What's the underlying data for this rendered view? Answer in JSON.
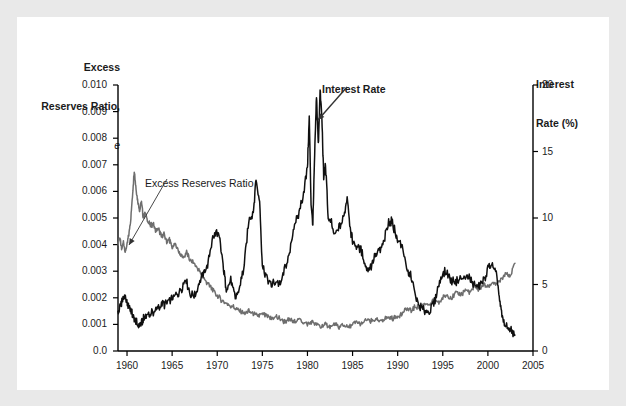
{
  "figure": {
    "background_color": "#e9e9e9",
    "panel_color": "#ffffff"
  },
  "chart_data": {
    "type": "line",
    "title": "",
    "xlabel": "",
    "ylabel": "Excess Reserves Ratio, e",
    "y2label": "Interest Rate (%)",
    "grid": false,
    "legend_position": "inline-annotations",
    "xlim": [
      1959.0,
      2005.0
    ],
    "ylim": [
      0.0,
      0.01
    ],
    "y2lim": [
      0,
      20
    ],
    "xticks": [
      1960,
      1965,
      1970,
      1975,
      1980,
      1985,
      1990,
      1995,
      2000,
      2005
    ],
    "xtick_labels": [
      "1960",
      "1965",
      "1970",
      "1975",
      "1980",
      "1985",
      "1990",
      "1995",
      "2000",
      "2005"
    ],
    "yticks": [
      0.0,
      0.001,
      0.002,
      0.003,
      0.004,
      0.005,
      0.006,
      0.007,
      0.008,
      0.009,
      0.01
    ],
    "ytick_labels": [
      "0.0",
      "0.001",
      "0.002",
      "0.003",
      "0.004",
      "0.005",
      "0.006",
      "0.007",
      "0.008",
      "0.009",
      "0.010"
    ],
    "y2ticks": [
      0,
      5,
      10,
      15,
      20
    ],
    "y2tick_labels": [
      "0",
      "5",
      "10",
      "15",
      "20"
    ],
    "series": [
      {
        "name": "Excess Reserves Ratio",
        "axis": "left",
        "color": "#6e6e6e",
        "annotation": "Excess Reserves Ratio",
        "x": [
          1959.0,
          1959.2,
          1959.4,
          1959.6,
          1959.8,
          1960.0,
          1960.2,
          1960.4,
          1960.6,
          1960.8,
          1961.0,
          1961.2,
          1961.4,
          1961.6,
          1961.8,
          1962.0,
          1962.3,
          1962.6,
          1962.9,
          1963.2,
          1963.5,
          1963.8,
          1964.1,
          1964.4,
          1964.7,
          1965.0,
          1965.4,
          1965.8,
          1966.2,
          1966.6,
          1967.0,
          1967.4,
          1967.8,
          1968.2,
          1968.6,
          1969.0,
          1969.5,
          1970.0,
          1970.5,
          1971.0,
          1971.5,
          1972.0,
          1972.5,
          1973.0,
          1973.5,
          1974.0,
          1974.5,
          1975.0,
          1975.5,
          1976.0,
          1976.5,
          1977.0,
          1977.5,
          1978.0,
          1978.5,
          1979.0,
          1979.5,
          1980.0,
          1980.5,
          1981.0,
          1981.5,
          1982.0,
          1982.5,
          1983.0,
          1983.5,
          1984.0,
          1984.5,
          1985.0,
          1985.5,
          1986.0,
          1986.5,
          1987.0,
          1987.5,
          1988.0,
          1988.5,
          1989.0,
          1989.5,
          1990.0,
          1990.5,
          1991.0,
          1991.5,
          1992.0,
          1992.5,
          1993.0,
          1993.5,
          1994.0,
          1994.5,
          1995.0,
          1995.5,
          1996.0,
          1996.5,
          1997.0,
          1997.5,
          1998.0,
          1998.5,
          1999.0,
          1999.5,
          2000.0,
          2000.5,
          2001.0,
          2001.5,
          2002.0,
          2002.5,
          2003.0
        ],
        "y": [
          0.004,
          0.0043,
          0.0038,
          0.0041,
          0.0037,
          0.004,
          0.0044,
          0.0049,
          0.0058,
          0.0068,
          0.0061,
          0.0056,
          0.0053,
          0.0056,
          0.005,
          0.0052,
          0.0049,
          0.0047,
          0.0048,
          0.0045,
          0.0046,
          0.0043,
          0.0044,
          0.0041,
          0.0042,
          0.0039,
          0.004,
          0.0037,
          0.0035,
          0.0037,
          0.0034,
          0.0033,
          0.0031,
          0.0029,
          0.0027,
          0.0025,
          0.0023,
          0.0021,
          0.0019,
          0.0018,
          0.0017,
          0.0016,
          0.0015,
          0.0014,
          0.0015,
          0.0014,
          0.0013,
          0.0014,
          0.0013,
          0.0012,
          0.0013,
          0.0012,
          0.0011,
          0.0012,
          0.0011,
          0.0012,
          0.0011,
          0.001,
          0.0011,
          0.001,
          0.0009,
          0.001,
          0.0009,
          0.001,
          0.0009,
          0.001,
          0.0009,
          0.001,
          0.0011,
          0.001,
          0.0012,
          0.0011,
          0.0012,
          0.0011,
          0.0012,
          0.0013,
          0.0012,
          0.0013,
          0.0014,
          0.0016,
          0.0015,
          0.0017,
          0.0016,
          0.0018,
          0.0017,
          0.0019,
          0.0018,
          0.002,
          0.0021,
          0.002,
          0.0022,
          0.0021,
          0.0023,
          0.0022,
          0.0024,
          0.0023,
          0.0025,
          0.0024,
          0.0026,
          0.0025,
          0.0027,
          0.0029,
          0.0028,
          0.0033
        ]
      },
      {
        "name": "Interest Rate",
        "axis": "right",
        "color": "#101010",
        "annotation": "Interest Rate",
        "x": [
          1959.0,
          1959.3,
          1959.6,
          1959.9,
          1960.2,
          1960.5,
          1960.8,
          1961.1,
          1961.4,
          1961.7,
          1962.0,
          1962.4,
          1962.8,
          1963.2,
          1963.6,
          1964.0,
          1964.5,
          1965.0,
          1965.5,
          1966.0,
          1966.5,
          1967.0,
          1967.5,
          1968.0,
          1968.5,
          1969.0,
          1969.5,
          1970.0,
          1970.3,
          1970.7,
          1971.0,
          1971.5,
          1972.0,
          1972.5,
          1973.0,
          1973.5,
          1974.0,
          1974.3,
          1974.7,
          1975.0,
          1975.5,
          1976.0,
          1976.5,
          1977.0,
          1977.5,
          1978.0,
          1978.5,
          1979.0,
          1979.5,
          1980.0,
          1980.2,
          1980.4,
          1980.6,
          1980.8,
          1981.0,
          1981.2,
          1981.4,
          1981.6,
          1981.8,
          1982.0,
          1982.3,
          1982.6,
          1983.0,
          1983.5,
          1984.0,
          1984.4,
          1984.8,
          1985.0,
          1985.5,
          1986.0,
          1986.5,
          1987.0,
          1987.5,
          1988.0,
          1988.5,
          1989.0,
          1989.3,
          1989.7,
          1990.0,
          1990.5,
          1991.0,
          1991.5,
          1992.0,
          1992.5,
          1993.0,
          1993.5,
          1994.0,
          1994.5,
          1995.0,
          1995.5,
          1996.0,
          1996.5,
          1997.0,
          1997.5,
          1998.0,
          1998.5,
          1999.0,
          1999.5,
          2000.0,
          2000.5,
          2001.0,
          2001.3,
          2001.6,
          2002.0,
          2002.5,
          2003.0
        ],
        "y": [
          2.8,
          3.6,
          4.0,
          3.8,
          3.3,
          3.0,
          2.3,
          2.0,
          1.9,
          2.2,
          2.6,
          2.8,
          2.9,
          3.1,
          3.3,
          3.5,
          3.6,
          4.0,
          4.2,
          4.6,
          5.4,
          4.3,
          4.1,
          5.2,
          5.8,
          6.6,
          8.6,
          8.9,
          8.3,
          6.2,
          4.7,
          5.3,
          4.0,
          4.8,
          6.5,
          9.8,
          10.5,
          12.9,
          11.2,
          6.4,
          5.5,
          5.0,
          5.3,
          4.9,
          6.3,
          7.2,
          9.4,
          10.2,
          11.6,
          13.8,
          17.6,
          11.0,
          9.5,
          14.8,
          19.1,
          15.5,
          19.6,
          17.5,
          13.0,
          14.0,
          10.0,
          9.7,
          8.6,
          9.3,
          10.0,
          11.6,
          9.0,
          8.2,
          7.8,
          7.5,
          6.2,
          6.3,
          7.1,
          7.5,
          8.3,
          9.6,
          9.8,
          9.0,
          8.2,
          8.0,
          6.0,
          5.7,
          4.0,
          3.3,
          3.0,
          3.0,
          3.6,
          4.8,
          5.9,
          5.8,
          5.3,
          5.3,
          5.4,
          5.5,
          5.5,
          5.0,
          4.8,
          5.2,
          6.2,
          6.5,
          5.5,
          3.8,
          2.4,
          1.8,
          1.7,
          1.2
        ]
      }
    ]
  },
  "left_axis": {
    "title_line1": "Excess",
    "title_line2": "Reserves Ratio,",
    "title_line3": "e"
  },
  "right_axis": {
    "title_line1": "Interest",
    "title_line2": "Rate (%)"
  }
}
